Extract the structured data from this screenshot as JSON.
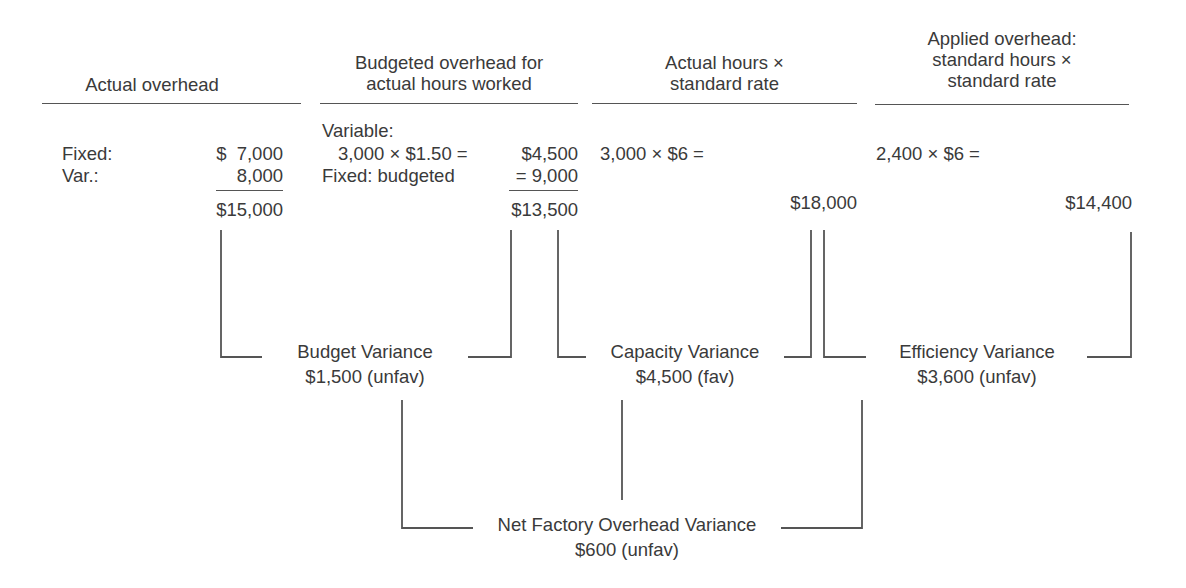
{
  "columns": [
    {
      "header": [
        "Actual overhead"
      ],
      "rows": [
        {
          "label": "Fixed:",
          "value": "$  7,000"
        },
        {
          "label": "Var.:",
          "value": "8,000"
        }
      ],
      "total": "$15,000"
    },
    {
      "header": [
        "Budgeted overhead for",
        "actual hours worked"
      ],
      "rows": [
        {
          "label": "Variable:",
          "value": ""
        },
        {
          "label": "3,000 × $1.50 =",
          "value": "$4,500"
        },
        {
          "label": "Fixed: budgeted",
          "value": "= 9,000"
        }
      ],
      "total": "$13,500"
    },
    {
      "header": [
        "Actual hours ×",
        "standard rate"
      ],
      "rows": [
        {
          "label": "3,000 × $6 =",
          "value": ""
        }
      ],
      "total": "$18,000"
    },
    {
      "header": [
        "Applied overhead:",
        "standard hours ×",
        "standard rate"
      ],
      "rows": [
        {
          "label": "2,400 × $6 =",
          "value": ""
        }
      ],
      "total": "$14,400"
    }
  ],
  "variances": [
    {
      "name": "Budget Variance",
      "amount": "$1,500 (unfav)"
    },
    {
      "name": "Capacity Variance",
      "amount": "$4,500 (fav)"
    },
    {
      "name": "Efficiency Variance",
      "amount": "$3,600 (unfav)"
    }
  ],
  "net": {
    "name": "Net Factory Overhead Variance",
    "amount": "$600 (unfav)"
  }
}
